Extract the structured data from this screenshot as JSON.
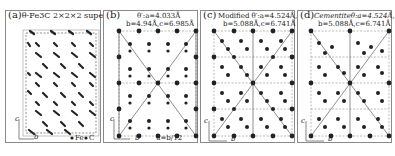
{
  "figure": {
    "panels": [
      {
        "id": "a",
        "label": "(a)",
        "title": "θ-Fe3C 2×2×2 supercell",
        "title_line2": "",
        "axes": {
          "vertical": "c",
          "horizontal": "b"
        },
        "legend": [
          {
            "symbol": "●",
            "label": "Fe"
          },
          {
            "symbol": "●",
            "label": "C"
          }
        ]
      },
      {
        "id": "b",
        "label": "(b)",
        "title": "θ′:a=4.033Å",
        "title_line2": "b=4.94Å,c=6.985Å",
        "axes": {
          "vertical": "c",
          "horizontal": "b"
        },
        "annotation": "u=b/12"
      },
      {
        "id": "c",
        "label": "(c)",
        "title": "Modified θ′:a=4.524Å,",
        "title_line2": "b=5.088Å,c=6.741Å",
        "axes": {
          "vertical": "c",
          "horizontal": "b"
        }
      },
      {
        "id": "d",
        "label": "(d)",
        "title": "Cementiteθ:a=4.524Å,",
        "title_line2": "b=5.088Å,c=6.741Å",
        "axes": {
          "vertical": "c",
          "horizontal": "b"
        }
      }
    ],
    "colors": {
      "atom": "#222222",
      "grid": "#666666",
      "border": "#8a8a8a"
    }
  }
}
